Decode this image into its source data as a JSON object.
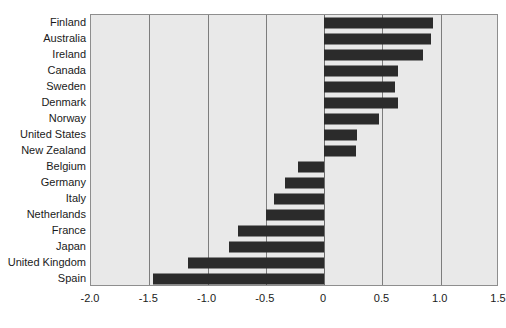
{
  "chart_data": {
    "type": "bar",
    "orientation": "horizontal",
    "title": "",
    "subtitle": "",
    "xlabel": "",
    "ylabel": "",
    "xlim": [
      -2.0,
      1.5
    ],
    "grid": true,
    "legend": false,
    "zero_line": 0,
    "xticks": [
      "-2.0",
      "-1.5",
      "-1.0",
      "-0.5",
      "0",
      "0.5",
      "1.0",
      "1.5"
    ],
    "xtick_values": [
      -2.0,
      -1.5,
      -1.0,
      -0.5,
      0,
      0.5,
      1.0,
      1.5
    ],
    "categories": [
      "Finland",
      "Australia",
      "Ireland",
      "Canada",
      "Sweden",
      "Denmark",
      "Norway",
      "United States",
      "New Zealand",
      "Belgium",
      "Germany",
      "Italy",
      "Netherlands",
      "France",
      "Japan",
      "United Kingdom",
      "Spain"
    ],
    "values": [
      0.93,
      0.92,
      0.85,
      0.63,
      0.61,
      0.63,
      0.47,
      0.28,
      0.27,
      -0.22,
      -0.34,
      -0.43,
      -0.5,
      -0.74,
      -0.82,
      -1.17,
      -1.47
    ],
    "bar_color": "#2b2b2b",
    "plot_background": "#e9e9e9",
    "grid_color": "#7d7d7d"
  }
}
